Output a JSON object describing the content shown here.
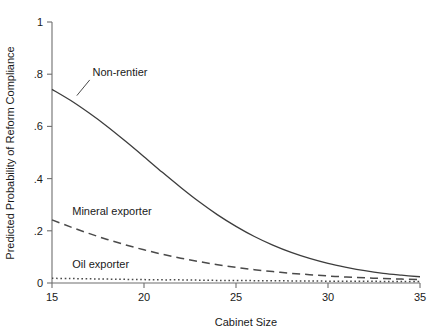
{
  "chart_data": {
    "type": "line",
    "title": "",
    "xlabel": "Cabinet Size",
    "ylabel": "Predicted Probability of Reform Compliance",
    "xlim": [
      15,
      35
    ],
    "ylim": [
      0,
      1
    ],
    "xticks": [
      "15",
      "20",
      "25",
      "30",
      "35"
    ],
    "xtick_values": [
      15,
      20,
      25,
      30,
      35
    ],
    "yticks": [
      "0",
      ".2",
      ".4",
      ".6",
      ".8",
      "1"
    ],
    "ytick_values": [
      0,
      0.2,
      0.4,
      0.6,
      0.8,
      1
    ],
    "grid": false,
    "legend_position": "inline-annotations",
    "x": [
      15,
      16,
      17,
      18,
      19,
      20,
      21,
      22,
      23,
      24,
      25,
      26,
      27,
      28,
      29,
      30,
      31,
      32,
      33,
      34,
      35
    ],
    "series": [
      {
        "name": "Non-rentier",
        "style": "solid",
        "color": "#3d3d3d",
        "label_x": 17.2,
        "label_y": 0.795,
        "values": [
          0.742,
          0.7,
          0.652,
          0.6,
          0.543,
          0.484,
          0.424,
          0.366,
          0.311,
          0.261,
          0.217,
          0.178,
          0.145,
          0.117,
          0.094,
          0.075,
          0.06,
          0.047,
          0.037,
          0.03,
          0.024
        ]
      },
      {
        "name": "Mineral exporter",
        "style": "dashed",
        "color": "#4a4a4a",
        "label_x": 16.1,
        "label_y": 0.262,
        "values": [
          0.242,
          0.215,
          0.19,
          0.167,
          0.146,
          0.127,
          0.11,
          0.095,
          0.082,
          0.07,
          0.06,
          0.051,
          0.044,
          0.037,
          0.032,
          0.027,
          0.023,
          0.02,
          0.017,
          0.015,
          0.013
        ]
      },
      {
        "name": "Oil exporter",
        "style": "dotted",
        "color": "#4a4a4a",
        "label_x": 16.1,
        "label_y": 0.057,
        "values": [
          0.018,
          0.017,
          0.016,
          0.015,
          0.014,
          0.013,
          0.012,
          0.012,
          0.011,
          0.01,
          0.01,
          0.009,
          0.009,
          0.008,
          0.008,
          0.007,
          0.007,
          0.007,
          0.006,
          0.006,
          0.006
        ]
      }
    ]
  }
}
